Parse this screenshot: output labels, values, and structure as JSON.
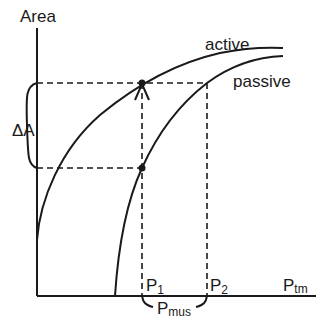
{
  "diagram": {
    "y_axis_label": "Area",
    "x_axis_label_main": "P",
    "x_axis_label_sub": "tm",
    "curves": {
      "active": "active",
      "passive": "passive"
    },
    "delta_area_label": "ΔA",
    "p1_main": "P",
    "p1_sub": "1",
    "p2_main": "P",
    "p2_sub": "2",
    "pmus_main": "P",
    "pmus_sub": "mus"
  }
}
